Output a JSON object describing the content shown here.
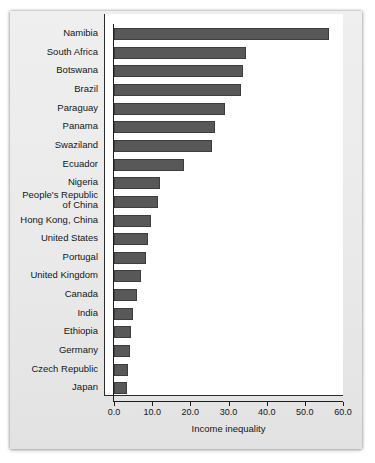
{
  "chart_data": {
    "type": "bar",
    "orientation": "horizontal",
    "title": "",
    "xlabel": "Income inequality",
    "ylabel": "",
    "xlim": [
      0,
      60
    ],
    "xticks": [
      "0.0",
      "10.0",
      "20.0",
      "30.0",
      "40.0",
      "50.0",
      "60.0"
    ],
    "xtick_values": [
      0,
      10,
      20,
      30,
      40,
      50,
      60
    ],
    "grid": false,
    "legend": null,
    "bar_color": "#585858",
    "bar_edge_color": "#3d3d3d",
    "background_color": "#ffffff",
    "page_color": "#ececec",
    "categories": [
      "Namibia",
      "South Africa",
      "Botswana",
      "Brazil",
      "Paraguay",
      "Panama",
      "Swaziland",
      "Ecuador",
      "Nigeria",
      "People's Republic\nof China",
      "Hong Kong, China",
      "United States",
      "Portugal",
      "United Kingdom",
      "Canada",
      "India",
      "Ethiopia",
      "Germany",
      "Czech Republic",
      "Japan"
    ],
    "values": [
      56.4,
      34.7,
      33.9,
      33.4,
      29.2,
      26.4,
      25.8,
      18.3,
      12.0,
      11.6,
      9.8,
      8.8,
      8.4,
      7.2,
      6.0,
      5.0,
      4.4,
      4.3,
      3.6,
      3.4
    ]
  }
}
